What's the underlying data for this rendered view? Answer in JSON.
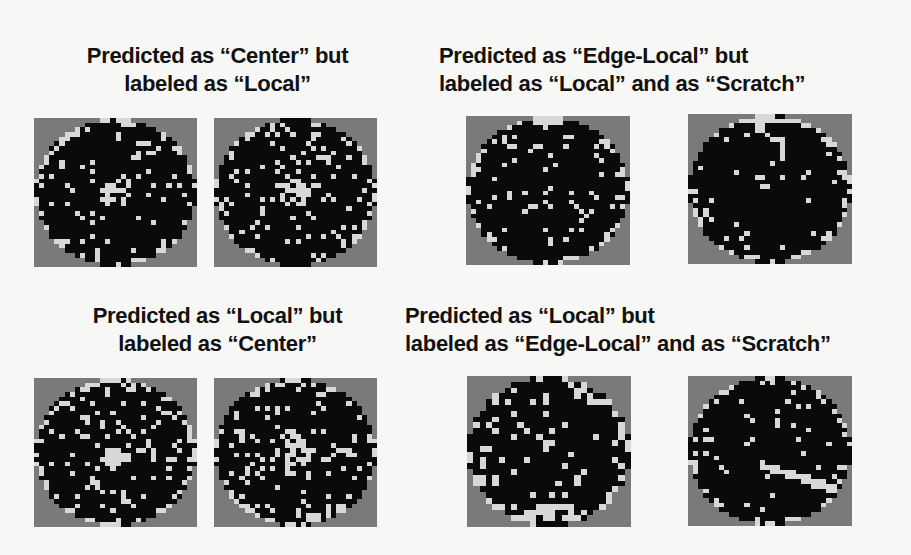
{
  "colors": {
    "background": "#f7f7f5",
    "outside": "#7a7a7a",
    "die_normal": "#0a0a0a",
    "die_defect": "#d8d8d8",
    "text": "#111111"
  },
  "panels": [
    {
      "id": "pred-center-label-local",
      "title_line1": "Predicted as “Center” but",
      "title_line2": "labeled as “Local”",
      "title": {
        "x": 55,
        "y": 42,
        "w": 325,
        "align": "center"
      },
      "wafers": [
        {
          "x": 34,
          "y": 118,
          "w": 163,
          "h": 149,
          "n": 32,
          "seed": 11,
          "density": 0.09,
          "pattern": "center"
        },
        {
          "x": 214,
          "y": 118,
          "w": 163,
          "h": 149,
          "n": 32,
          "seed": 23,
          "density": 0.08,
          "pattern": "center"
        }
      ]
    },
    {
      "id": "pred-edgelocal-label-local-scratch",
      "title_line1": "Predicted as “Edge-Local” but",
      "title_line2": "labeled as “Local” and as “Scratch”",
      "title": {
        "x": 439,
        "y": 42,
        "w": 420,
        "align": "left"
      },
      "wafers": [
        {
          "x": 466,
          "y": 116,
          "w": 164,
          "h": 149,
          "n": 32,
          "seed": 37,
          "density": 0.08,
          "pattern": "edge-top"
        },
        {
          "x": 688,
          "y": 114,
          "w": 164,
          "h": 150,
          "n": 32,
          "seed": 41,
          "density": 0.06,
          "pattern": "scratch-top"
        }
      ]
    },
    {
      "id": "pred-local-label-center",
      "title_line1": "Predicted as “Local” but",
      "title_line2": "labeled as “Center”",
      "title": {
        "x": 55,
        "y": 302,
        "w": 325,
        "align": "center"
      },
      "wafers": [
        {
          "x": 34,
          "y": 378,
          "w": 163,
          "h": 149,
          "n": 32,
          "seed": 53,
          "density": 0.13,
          "pattern": "center"
        },
        {
          "x": 214,
          "y": 378,
          "w": 163,
          "h": 149,
          "n": 32,
          "seed": 67,
          "density": 0.1,
          "pattern": "center"
        }
      ]
    },
    {
      "id": "pred-local-label-edgelocal-scratch",
      "title_line1": "Predicted as “Local” but",
      "title_line2": "labeled as “Edge-Local” and as “Scratch”",
      "title": {
        "x": 405,
        "y": 302,
        "w": 500,
        "align": "left"
      },
      "wafers": [
        {
          "x": 467,
          "y": 376,
          "w": 164,
          "h": 151,
          "n": 26,
          "seed": 71,
          "density": 0.11,
          "pattern": "edge-bottom"
        },
        {
          "x": 688,
          "y": 376,
          "w": 164,
          "h": 150,
          "n": 32,
          "seed": 89,
          "density": 0.07,
          "pattern": "scratch-diag"
        }
      ]
    }
  ]
}
